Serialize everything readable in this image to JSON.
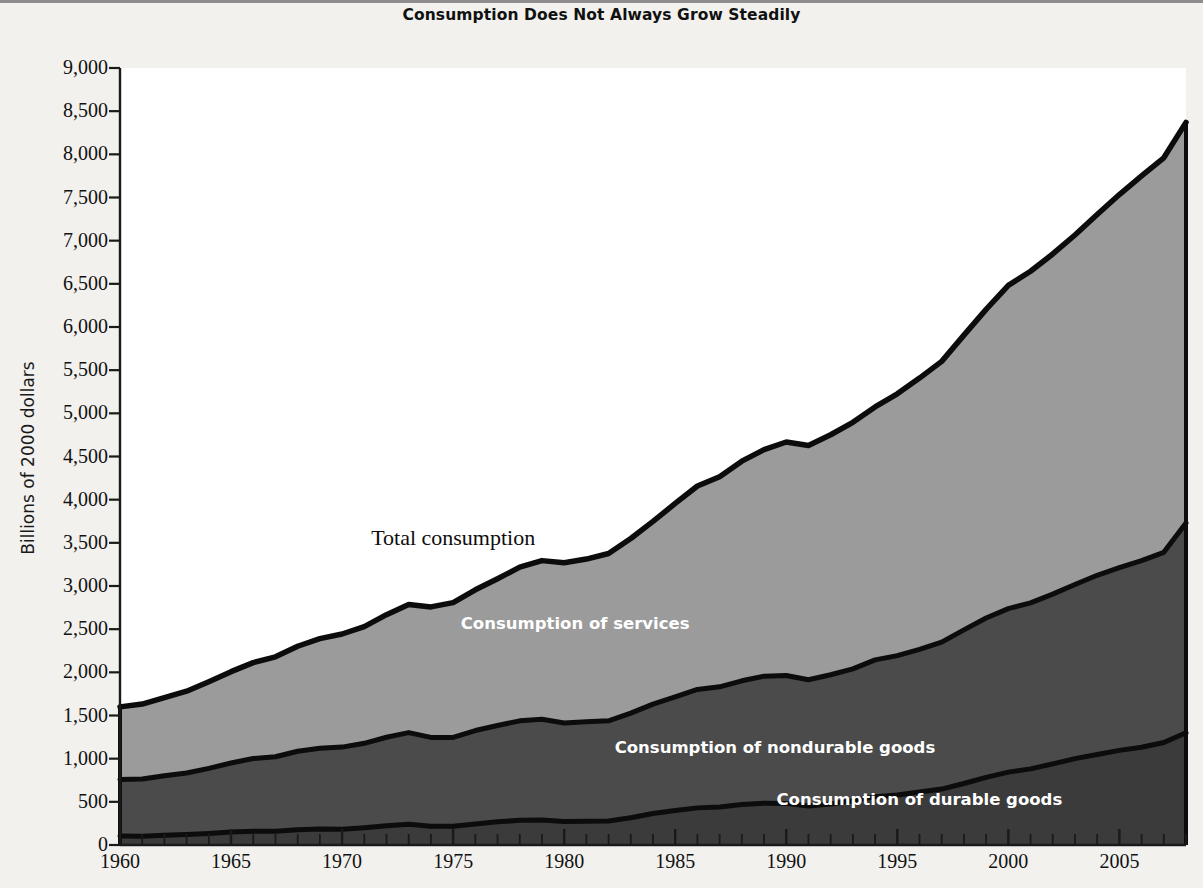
{
  "title": "Consumption Does Not Always Grow Steadily",
  "axis": {
    "ylabel": "Billions of 2000 dollars",
    "xlabel": ""
  },
  "series_labels": {
    "total": "Total consumption",
    "services": "Consumption of services",
    "nondurable": "Consumption of nondurable goods",
    "durable": "Consumption of durable goods"
  },
  "colors": {
    "services_fill": "#9b9b9b",
    "nondurable_fill": "#4b4b4b",
    "durable_fill": "#3b3b3b",
    "outline": "#0c0c0c",
    "page_background": "#f2f1ee",
    "plot_background": "#ffffff",
    "axis": "#1a1a1a",
    "inside_label_text": "#ffffff"
  },
  "chart_data": {
    "type": "area",
    "title": "Consumption Does Not Always Grow Steadily",
    "xlabel": "",
    "ylabel": "Billions of 2000 dollars",
    "xlim": [
      1960,
      2008
    ],
    "ylim": [
      0,
      9000
    ],
    "ytick_labels": [
      "9,000",
      "8,500",
      "8,000",
      "7,500",
      "7,000",
      "6,500",
      "6,000",
      "5,500",
      "5,000",
      "4,500",
      "4,000",
      "3,500",
      "3,000",
      "2,500",
      "2,000",
      "1,500",
      "1,000",
      "500",
      "0"
    ],
    "yticks": [
      9000,
      8500,
      8000,
      7500,
      7000,
      6500,
      6000,
      5500,
      5000,
      4500,
      4000,
      3500,
      3000,
      2500,
      2000,
      1500,
      1000,
      500,
      0
    ],
    "xtick_labels": [
      "1960",
      "1965",
      "1970",
      "1975",
      "1980",
      "1985",
      "1990",
      "1995",
      "2000",
      "2005"
    ],
    "xticks": [
      1960,
      1965,
      1970,
      1975,
      1980,
      1985,
      1990,
      1995,
      2000,
      2005
    ],
    "minor_xtick_interval": 1,
    "grid": false,
    "legend": "inline-annotations",
    "stacked": true,
    "stack_order_bottom_to_top": [
      "durable",
      "nondurable",
      "services"
    ],
    "x": [
      1960,
      1961,
      1962,
      1963,
      1964,
      1965,
      1966,
      1967,
      1968,
      1969,
      1970,
      1971,
      1972,
      1973,
      1974,
      1975,
      1976,
      1977,
      1978,
      1979,
      1980,
      1981,
      1982,
      1983,
      1984,
      1985,
      1986,
      1987,
      1988,
      1989,
      1990,
      1991,
      1992,
      1993,
      1994,
      1995,
      1996,
      1997,
      1998,
      1999,
      2000,
      2001,
      2002,
      2003,
      2004,
      2005,
      2006,
      2007,
      2008
    ],
    "series": [
      {
        "name": "Consumption of durable goods",
        "fill": "#3b3b3b",
        "values": [
          105,
          100,
          112,
          122,
          134,
          150,
          160,
          160,
          178,
          186,
          182,
          200,
          222,
          240,
          218,
          216,
          244,
          268,
          286,
          290,
          272,
          276,
          278,
          316,
          364,
          400,
          430,
          440,
          468,
          484,
          482,
          452,
          476,
          512,
          560,
          580,
          614,
          648,
          712,
          784,
          844,
          882,
          940,
          1000,
          1048,
          1096,
          1132,
          1188,
          1300
        ],
        "label_text": "Consumption of durable goods"
      },
      {
        "name": "Consumption of nondurable goods",
        "fill": "#4b4b4b",
        "values": [
          655,
          665,
          690,
          712,
          754,
          800,
          842,
          862,
          908,
          934,
          952,
          978,
          1026,
          1062,
          1028,
          1030,
          1082,
          1116,
          1152,
          1166,
          1142,
          1152,
          1160,
          1212,
          1268,
          1316,
          1372,
          1392,
          1434,
          1472,
          1482,
          1462,
          1496,
          1528,
          1584,
          1614,
          1652,
          1702,
          1780,
          1846,
          1894,
          1922,
          1966,
          2018,
          2076,
          2118,
          2162,
          2202,
          2430
        ],
        "label_text": "Consumption of nondurable goods"
      },
      {
        "name": "Consumption of services",
        "fill": "#9b9b9b",
        "values": [
          840,
          868,
          906,
          948,
          1004,
          1058,
          1110,
          1158,
          1216,
          1270,
          1310,
          1352,
          1420,
          1484,
          1512,
          1562,
          1630,
          1700,
          1780,
          1838,
          1856,
          1884,
          1938,
          2022,
          2116,
          2240,
          2356,
          2434,
          2544,
          2624,
          2704,
          2714,
          2780,
          2856,
          2930,
          3032,
          3142,
          3252,
          3414,
          3574,
          3744,
          3842,
          3940,
          4048,
          4180,
          4320,
          4456,
          4570,
          4640
        ],
        "label_text": "Consumption of services"
      }
    ],
    "total": {
      "name": "Total consumption",
      "values": [
        1600,
        1633,
        1708,
        1782,
        1892,
        2008,
        2112,
        2180,
        2302,
        2390,
        2444,
        2530,
        2668,
        2786,
        2758,
        2808,
        2956,
        3084,
        3218,
        3294,
        3270,
        3312,
        3376,
        3550,
        3748,
        3956,
        4158,
        4266,
        4446,
        4580,
        4668,
        4628,
        4752,
        4896,
        5074,
        5226,
        5408,
        5602,
        5906,
        6204,
        6482,
        6646,
        6846,
        7066,
        7304,
        7534,
        7750,
        7960,
        8370
      ],
      "label_text": "Total consumption"
    },
    "annotations": [
      {
        "text": "Total consumption",
        "x": 1975,
        "y": 3560
      },
      {
        "text": "Consumption of services",
        "x": 1980.5,
        "y": 2560
      },
      {
        "text": "Consumption of nondurable goods",
        "x": 1989.5,
        "y": 1130
      },
      {
        "text": "Consumption of durable goods",
        "x": 1996,
        "y": 530
      }
    ]
  }
}
